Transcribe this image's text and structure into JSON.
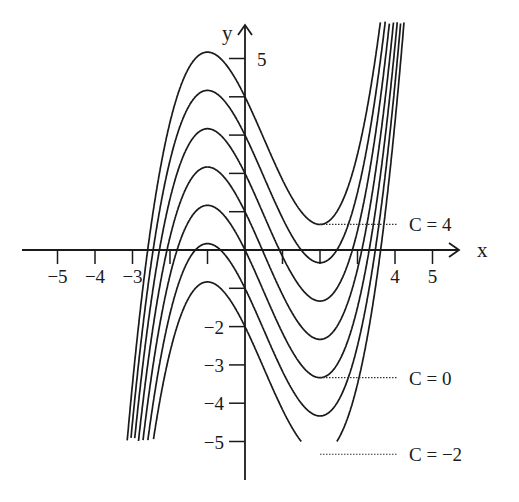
{
  "chart_data": {
    "type": "line",
    "title": "",
    "xlabel": "x",
    "ylabel": "y",
    "xlim": [
      -6,
      5.5
    ],
    "ylim": [
      -5.5,
      5.5
    ],
    "grid": false,
    "x_ticks": [
      -5,
      -4,
      -3,
      -2,
      -1,
      1,
      2,
      3,
      4,
      5
    ],
    "x_tick_labels": [
      {
        "value": -5,
        "label": "−5"
      },
      {
        "value": -4,
        "label": "−4"
      },
      {
        "value": -3,
        "label": "−3"
      },
      {
        "value": 4,
        "label": "4"
      },
      {
        "value": 5,
        "label": "5"
      }
    ],
    "y_ticks": [
      -5,
      -4,
      -3,
      -2,
      -1,
      1,
      2,
      3,
      4,
      5
    ],
    "y_tick_labels": [
      {
        "value": 5,
        "label": "5"
      },
      {
        "value": -2,
        "label": "−2"
      },
      {
        "value": -3,
        "label": "−3"
      },
      {
        "value": -4,
        "label": "−4"
      },
      {
        "value": -5,
        "label": "−5"
      }
    ],
    "equation": "y = x^3/3 - x^2/2 - 2x + C",
    "series": [
      {
        "name": "C = 4",
        "C": 4
      },
      {
        "name": "C = 3",
        "C": 3
      },
      {
        "name": "C = 2",
        "C": 2
      },
      {
        "name": "C = 1",
        "C": 1
      },
      {
        "name": "C = 0",
        "C": 0
      },
      {
        "name": "C = -1",
        "C": -1
      },
      {
        "name": "C = -2",
        "C": -2
      }
    ],
    "annotations": [
      {
        "text": "C = 4",
        "at_series": 4,
        "x": 2,
        "y": 0.67
      },
      {
        "text": "C = 0",
        "at_series": 0,
        "x": 2,
        "y": -3.33
      },
      {
        "text": "C = −2",
        "at_series": -2,
        "x": 2,
        "y": -5.33
      }
    ],
    "y_clip": [
      -5,
      6
    ]
  },
  "labels": {
    "x_axis": "x",
    "y_axis": "y"
  }
}
